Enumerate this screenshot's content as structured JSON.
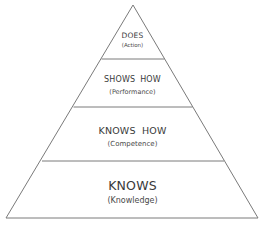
{
  "diagram": {
    "type": "pyramid",
    "line_color": "#7a7a7a",
    "text_color": "#3a3a3a",
    "fill_color": "#ffffff",
    "levels": [
      {
        "position": "top",
        "title": "DOES",
        "subtitle": "(Action)"
      },
      {
        "position": "second",
        "title": "SHOWS HOW",
        "subtitle": "(Performance)"
      },
      {
        "position": "third",
        "title": "KNOWS HOW",
        "subtitle": "(Competence)"
      },
      {
        "position": "base",
        "title": "KNOWS",
        "subtitle": "(Knowledge)"
      }
    ]
  }
}
